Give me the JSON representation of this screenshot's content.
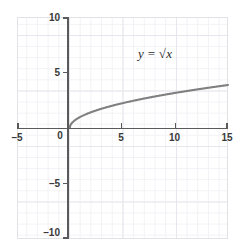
{
  "chart_data": {
    "type": "line",
    "title": "",
    "subtitle": "",
    "xlabel": "",
    "ylabel": "",
    "annotation": "y = √x",
    "equation_parts": {
      "lhs": "y",
      "operator": "=",
      "radical": "√",
      "argument": "x"
    },
    "xlim": [
      -5,
      15
    ],
    "ylim": [
      -10,
      10
    ],
    "xticks": [
      -5,
      0,
      5,
      10,
      15
    ],
    "yticks": [
      -10,
      -5,
      0,
      5,
      10
    ],
    "xtick_labels": [
      "–5",
      "0",
      "5",
      "10",
      "15"
    ],
    "ytick_labels": [
      "–10",
      "–5",
      "",
      "5",
      "10"
    ],
    "grid": true,
    "grid_major_step": 5,
    "grid_minor_step": 1,
    "legend": "none",
    "series": [
      {
        "name": "y = √x",
        "color": "#808080",
        "domain": [
          0,
          15
        ],
        "x": [
          0,
          0.25,
          0.5,
          1,
          1.5,
          2,
          2.5,
          3,
          4,
          5,
          6,
          7,
          8,
          9,
          10,
          11,
          12,
          13,
          14,
          15
        ],
        "values": [
          0,
          0.5,
          0.71,
          1,
          1.22,
          1.41,
          1.58,
          1.73,
          2,
          2.24,
          2.45,
          2.65,
          2.83,
          3,
          3.16,
          3.32,
          3.46,
          3.61,
          3.74,
          3.87
        ]
      }
    ]
  },
  "colors": {
    "curve": "#808080",
    "axis": "#5a5a5a",
    "grid_major": "#e6e6ec",
    "grid_minor": "#f2f2f6",
    "text": "#3a3a3a",
    "background": "#ffffff"
  },
  "labels": {
    "x": {
      "neg5": "–5",
      "zero": "0",
      "five": "5",
      "ten": "10",
      "fifteen": "15"
    },
    "y": {
      "ten": "10",
      "five": "5",
      "neg5": "–5",
      "neg10": "–10"
    }
  }
}
